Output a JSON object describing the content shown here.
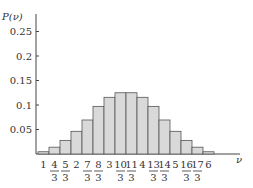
{
  "chart_data": {
    "type": "bar",
    "title": "",
    "xlabel": "ν",
    "ylabel": "P(ν)",
    "ylim": [
      0,
      0.28
    ],
    "yticks": [
      "0.05",
      "0.1",
      "0.15",
      "0.2",
      "0.25"
    ],
    "ytick_values": [
      0.05,
      0.1,
      0.15,
      0.2,
      0.25
    ],
    "grid": false,
    "legend": null,
    "categories": [
      "1",
      "4/3",
      "5/3",
      "2",
      "7/3",
      "8/3",
      "3",
      "10/3",
      "11/3",
      "4",
      "13/3",
      "14/3",
      "5",
      "16/3",
      "17/3",
      "6"
    ],
    "values": [
      0.0046,
      0.0139,
      0.0278,
      0.0463,
      0.0694,
      0.0972,
      0.1157,
      0.125,
      0.125,
      0.1157,
      0.0972,
      0.0694,
      0.0463,
      0.0278,
      0.0139,
      0.0046
    ],
    "bar_color": "#d9d9d9",
    "edge_color": "#555555"
  }
}
